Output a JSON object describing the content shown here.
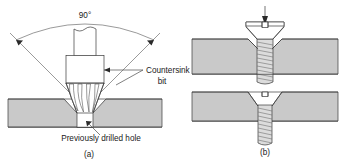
{
  "figure": {
    "background_color": "#ffffff",
    "line_color": "#3a3a3a",
    "metal_fill_color": "#c9c9c9",
    "text_color": "#1a1a1a"
  },
  "panel_a": {
    "caption": "(a)",
    "angle_label": "90°",
    "callout_bit_line1": "Countersink",
    "callout_bit_line2": "bit",
    "callout_hole": "Previously drilled hole",
    "parts": {
      "tool_name": "countersink-bit",
      "workpiece_name": "workpiece-plate",
      "hole_name": "previously-drilled-hole"
    }
  },
  "panel_b": {
    "caption": "(b)",
    "top_assembly": {
      "name": "flat-head-screw-seated-upper",
      "arrow_name": "downward-insertion-arrow"
    },
    "bottom_assembly": {
      "name": "flat-head-screw-seated-lower"
    }
  }
}
